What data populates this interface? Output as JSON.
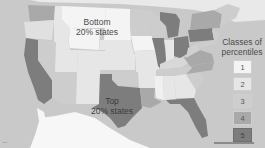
{
  "labels": {
    "bottom": "Bottom\n20% states",
    "bottom_line1": "Bottom",
    "bottom_line2": "20% states",
    "top_line1": "Top",
    "top_line2": "20% states"
  },
  "legend": {
    "title_line1": "Classes of",
    "title_line2": "percentiles",
    "classes": [
      {
        "label": "1",
        "color": "#f4f4f4"
      },
      {
        "label": "2",
        "color": "#e6e6e6"
      },
      {
        "label": "3",
        "color": "#cdcdcd"
      },
      {
        "label": "4",
        "color": "#a9a9a9"
      },
      {
        "label": "5",
        "color": "#7d7d7d"
      }
    ]
  },
  "colors": {
    "ocean": "#c9c9c9",
    "class1": "#f4f4f4",
    "class2": "#e6e6e6",
    "class3": "#cdcdcd",
    "class4": "#a9a9a9",
    "class5": "#7d7d7d",
    "mexico": "#f7f7f7"
  },
  "footer": {
    "left_text": "▪▪ ▪"
  }
}
